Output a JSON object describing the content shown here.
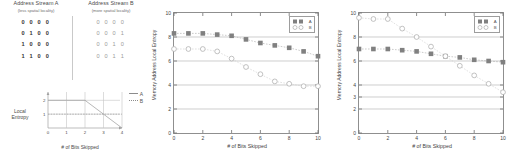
{
  "streams": {
    "left": {
      "title": "Address Stream A",
      "subtitle": "(less spatial locality)",
      "words": [
        "0 0 0 0",
        "0 1 0 0",
        "1 0 0 0",
        "1 1 0 0"
      ]
    },
    "right": {
      "title": "Address Stream B",
      "subtitle": "(more spatial locality)",
      "words": [
        "0 0 0 0",
        "0 0 0 1",
        "0 0 1 0",
        "0 0 1 1"
      ]
    }
  },
  "inset": {
    "ylabel_line1": "Local",
    "ylabel_line2": "Entropy",
    "xlabel": "# of Bits Skipped",
    "legend": [
      {
        "label": "A",
        "style": "solid"
      },
      {
        "label": "B",
        "style": "dotted"
      }
    ],
    "chart_data": {
      "type": "line",
      "title": "",
      "xlabel": "# of Bits Skipped",
      "ylabel": "Local Entropy",
      "xlim": [
        0,
        4
      ],
      "ylim": [
        0,
        2.6
      ],
      "xticks": [
        0,
        1,
        2,
        3,
        4
      ],
      "yticks": [
        1,
        2
      ],
      "grid": true,
      "legend_position": "top-right",
      "series": [
        {
          "name": "A",
          "x": [
            0,
            1,
            2,
            3,
            4
          ],
          "values": [
            2,
            2,
            2,
            1,
            0
          ]
        },
        {
          "name": "B",
          "x": [
            0,
            1,
            2,
            3,
            4
          ],
          "values": [
            1,
            1,
            1,
            1,
            1
          ]
        }
      ]
    }
  },
  "chart_left": {
    "ylabel": "Memory Address Local Entropy",
    "xlabel": "# of Bits Skipped",
    "legend": [
      {
        "label": "A",
        "marker": "filled-square"
      },
      {
        "label": "B",
        "marker": "open-circle"
      }
    ],
    "chart_data": {
      "type": "line",
      "title": "",
      "xlabel": "# of Bits Skipped",
      "ylabel": "Memory Address Local Entropy",
      "xlim": [
        0,
        10
      ],
      "ylim": [
        0,
        10
      ],
      "xticks": [
        0,
        2,
        4,
        6,
        8,
        10
      ],
      "yticks": [
        0,
        2,
        4,
        6,
        8,
        10
      ],
      "grid": true,
      "legend_position": "top-right",
      "series": [
        {
          "name": "A",
          "marker": "filled-square",
          "x": [
            0,
            1,
            2,
            3,
            4,
            5,
            6,
            7,
            8,
            9,
            10
          ],
          "values": [
            8.3,
            8.3,
            8.3,
            8.2,
            8.1,
            7.8,
            7.5,
            7.3,
            7.1,
            6.8,
            6.4
          ]
        },
        {
          "name": "B",
          "marker": "open-circle",
          "x": [
            0,
            1,
            2,
            3,
            4,
            5,
            6,
            7,
            8,
            9,
            10
          ],
          "values": [
            7.0,
            7.0,
            7.0,
            6.8,
            6.2,
            5.5,
            4.9,
            4.3,
            4.1,
            3.9,
            3.9
          ]
        }
      ]
    }
  },
  "chart_right": {
    "ylabel": "Memory Address Local Entropy",
    "xlabel": "# of Bits Skipped",
    "legend": [
      {
        "label": "A",
        "marker": "filled-square"
      },
      {
        "label": "B",
        "marker": "open-circle"
      }
    ],
    "chart_data": {
      "type": "line",
      "title": "",
      "xlabel": "# of Bits Skipped",
      "ylabel": "Memory Address Local Entropy",
      "xlim": [
        0,
        10
      ],
      "ylim": [
        0,
        10
      ],
      "xticks": [
        0,
        2,
        4,
        6,
        8,
        10
      ],
      "yticks": [
        0,
        2,
        3,
        4,
        6,
        8,
        10
      ],
      "grid": true,
      "legend_position": "top-right",
      "series": [
        {
          "name": "A",
          "marker": "filled-square",
          "x": [
            0,
            1,
            2,
            3,
            4,
            5,
            6,
            7,
            8,
            9,
            10
          ],
          "values": [
            7.0,
            7.0,
            7.0,
            6.9,
            6.8,
            6.6,
            6.4,
            6.3,
            6.1,
            6.0,
            5.9
          ]
        },
        {
          "name": "B",
          "marker": "open-circle",
          "x": [
            0,
            1,
            2,
            3,
            4,
            5,
            6,
            7,
            8,
            9,
            10
          ],
          "values": [
            9.6,
            9.5,
            9.5,
            8.7,
            8.0,
            7.2,
            6.4,
            5.6,
            4.8,
            4.1,
            3.4
          ]
        }
      ]
    }
  },
  "colors": {
    "marker_filled": "#808080",
    "marker_open": "#b8b8b8",
    "axis": "#8f8f8f",
    "grid": "#b9b9b9",
    "text": "#3f3f3f"
  }
}
